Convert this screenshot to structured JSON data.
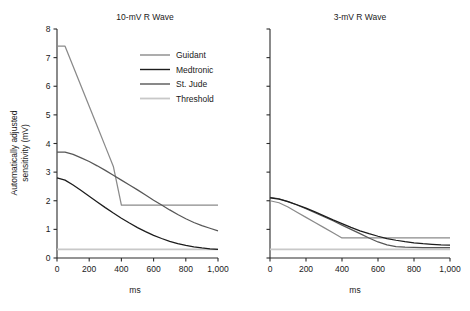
{
  "figure": {
    "ylabel": "Automatically adjusted sensitivity (mV)",
    "ylabel_line1": "Automatically adjusted",
    "ylabel_line2": "sensitivity (mV)",
    "xlabel_left": "ms",
    "xlabel_right": "ms"
  },
  "legend": {
    "items": [
      {
        "label": "Guidant",
        "color": "#8a8a8a"
      },
      {
        "label": "Medtronic",
        "color": "#1c1c1c"
      },
      {
        "label": "St. Jude",
        "color": "#575757"
      },
      {
        "label": "Threshold",
        "color": "#c8c8c8"
      }
    ]
  },
  "axis": {
    "y_ticks": [
      "0",
      "1",
      "2",
      "3",
      "4",
      "5",
      "6",
      "7",
      "8"
    ],
    "x_ticks": [
      "0",
      "200",
      "400",
      "600",
      "800",
      "1,000"
    ],
    "y_values": [
      0,
      1,
      2,
      3,
      4,
      5,
      6,
      7,
      8
    ],
    "x_values": [
      0,
      200,
      400,
      600,
      800,
      1000
    ]
  },
  "chart_data": [
    {
      "type": "line",
      "title": "10-mV R Wave",
      "xlabel": "ms",
      "ylabel": "Automatically adjusted sensitivity (mV)",
      "xlim": [
        0,
        1000
      ],
      "ylim": [
        0,
        8
      ],
      "grid": false,
      "legend_position": "upper-center",
      "x": [
        0,
        50,
        100,
        150,
        200,
        250,
        300,
        350,
        400,
        450,
        500,
        550,
        600,
        650,
        700,
        750,
        800,
        850,
        900,
        950,
        1000
      ],
      "series": [
        {
          "name": "Guidant",
          "color": "#8a8a8a",
          "values": [
            7.4,
            7.4,
            6.7,
            6.0,
            5.3,
            4.6,
            3.9,
            3.2,
            1.85,
            1.85,
            1.85,
            1.85,
            1.85,
            1.85,
            1.85,
            1.85,
            1.85,
            1.85,
            1.85,
            1.85,
            1.85
          ]
        },
        {
          "name": "Medtronic",
          "color": "#1c1c1c",
          "values": [
            2.8,
            2.72,
            2.55,
            2.36,
            2.16,
            1.96,
            1.76,
            1.57,
            1.39,
            1.22,
            1.06,
            0.92,
            0.79,
            0.68,
            0.58,
            0.5,
            0.44,
            0.39,
            0.35,
            0.32,
            0.3
          ]
        },
        {
          "name": "St. Jude",
          "color": "#575757",
          "values": [
            3.7,
            3.7,
            3.62,
            3.5,
            3.37,
            3.22,
            3.06,
            2.89,
            2.72,
            2.55,
            2.38,
            2.2,
            2.02,
            1.85,
            1.68,
            1.52,
            1.37,
            1.24,
            1.13,
            1.04,
            0.95
          ]
        },
        {
          "name": "Threshold",
          "color": "#c8c8c8",
          "values": [
            0.3,
            0.3,
            0.3,
            0.3,
            0.3,
            0.3,
            0.3,
            0.3,
            0.3,
            0.3,
            0.3,
            0.3,
            0.3,
            0.3,
            0.3,
            0.3,
            0.3,
            0.3,
            0.3,
            0.3,
            0.3
          ]
        }
      ]
    },
    {
      "type": "line",
      "title": "3-mV R Wave",
      "xlabel": "ms",
      "ylabel": "Automatically adjusted sensitivity (mV)",
      "xlim": [
        0,
        1000
      ],
      "ylim": [
        0,
        8
      ],
      "grid": false,
      "legend_position": "none",
      "x": [
        0,
        50,
        100,
        150,
        200,
        250,
        300,
        350,
        400,
        450,
        500,
        550,
        600,
        650,
        700,
        750,
        800,
        850,
        900,
        950,
        1000
      ],
      "series": [
        {
          "name": "Guidant",
          "color": "#8a8a8a",
          "values": [
            2.0,
            1.93,
            1.78,
            1.6,
            1.42,
            1.24,
            1.06,
            0.88,
            0.7,
            0.7,
            0.7,
            0.7,
            0.7,
            0.7,
            0.7,
            0.7,
            0.7,
            0.7,
            0.7,
            0.7,
            0.7
          ]
        },
        {
          "name": "Medtronic",
          "color": "#1c1c1c",
          "values": [
            2.1,
            2.06,
            1.97,
            1.86,
            1.74,
            1.61,
            1.47,
            1.33,
            1.2,
            1.07,
            0.95,
            0.85,
            0.76,
            0.68,
            0.62,
            0.57,
            0.53,
            0.5,
            0.48,
            0.46,
            0.45
          ]
        },
        {
          "name": "St. Jude",
          "color": "#575757",
          "values": [
            2.12,
            2.07,
            1.97,
            1.85,
            1.72,
            1.58,
            1.44,
            1.3,
            1.15,
            1.0,
            0.85,
            0.7,
            0.56,
            0.46,
            0.4,
            0.38,
            0.37,
            0.36,
            0.36,
            0.36,
            0.36
          ]
        },
        {
          "name": "Threshold",
          "color": "#c8c8c8",
          "values": [
            0.3,
            0.3,
            0.3,
            0.3,
            0.3,
            0.3,
            0.3,
            0.3,
            0.3,
            0.3,
            0.3,
            0.3,
            0.3,
            0.3,
            0.3,
            0.3,
            0.3,
            0.3,
            0.3,
            0.3,
            0.3
          ]
        }
      ]
    }
  ]
}
